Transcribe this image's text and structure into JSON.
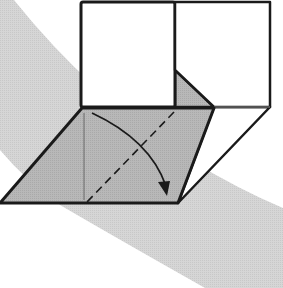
{
  "diagram": {
    "type": "origami-fold-step",
    "colors": {
      "background": "#ffffff",
      "band": "#d4d4d4",
      "paper_colored": "#b5b5b5",
      "paper_white": "#ffffff",
      "line": "#1a1a1a"
    },
    "elements": {
      "left_square": "white square panel (upper left)",
      "right_square": "white square panel (upper right)",
      "gray_flap": "colored parallelogram flap",
      "right_white_flap": "white slanted side flap",
      "inner_triangle": "colored triangle visible behind flap",
      "valley_fold_line": "dashed valley-fold line",
      "fold_arrow": "curved arrow indicating fold direction",
      "reference_crease": "thin vertical crease line"
    }
  }
}
